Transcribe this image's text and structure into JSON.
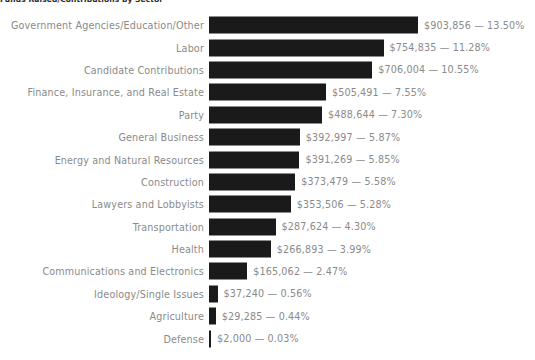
{
  "chart": {
    "title": "Funds Raised/Contributions by Sector",
    "value_separator": " — "
  },
  "chart_data": {
    "type": "bar",
    "orientation": "horizontal",
    "title": "Funds Raised/Contributions by Sector",
    "xlabel": "",
    "ylabel": "",
    "grid": false,
    "legend": "none",
    "axis_visible": false,
    "bar_color": "#1a1a1a",
    "label_color": "#8a8a8a",
    "background_color": "#ffffff",
    "xlim": [
      0,
      903856
    ],
    "categories": [
      "Government Agencies/Education/Other",
      "Labor",
      "Candidate Contributions",
      "Finance, Insurance, and Real Estate",
      "Party",
      "General Business",
      "Energy and Natural Resources",
      "Construction",
      "Lawyers and Lobbyists",
      "Transportation",
      "Health",
      "Communications and Electronics",
      "Ideology/Single Issues",
      "Agriculture",
      "Defense"
    ],
    "values": [
      903856,
      754835,
      706004,
      505491,
      488644,
      392997,
      391269,
      373479,
      353506,
      287624,
      266893,
      165062,
      37240,
      29285,
      2000
    ],
    "percents": [
      13.5,
      11.28,
      10.55,
      7.55,
      7.3,
      5.87,
      5.85,
      5.58,
      5.28,
      4.3,
      3.99,
      2.47,
      0.56,
      0.44,
      0.03
    ],
    "value_labels": [
      "$903,856 — 13.50%",
      "$754,835 — 11.28%",
      "$706,004 — 10.55%",
      "$505,491 — 7.55%",
      "$488,644 — 7.30%",
      "$392,997 — 5.87%",
      "$391,269 — 5.85%",
      "$373,479 — 5.58%",
      "$353,506 — 5.28%",
      "$287,624 — 4.30%",
      "$266,893 — 3.99%",
      "$165,062 — 2.47%",
      "$37,240 — 0.56%",
      "$29,285 — 0.44%",
      "$2,000 — 0.03%"
    ]
  }
}
